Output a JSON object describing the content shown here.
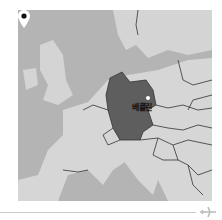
{
  "map": {
    "region": "Europe",
    "highlighted_country": "Germany",
    "marker": {
      "label": "베를린",
      "icon": "map-pin-icon"
    },
    "colors": {
      "water": "#b4b4b4",
      "land": "#d6d6d6",
      "highlight": "#5e5e5e",
      "border": "#333333"
    }
  },
  "footer": {
    "icon": "airplane-icon"
  }
}
